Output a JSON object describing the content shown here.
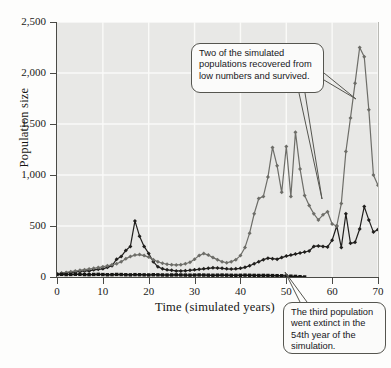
{
  "chart_data": {
    "type": "line",
    "title": "",
    "xlabel": "Time (simulated years)",
    "ylabel": "Population size",
    "xlim": [
      0,
      70
    ],
    "ylim": [
      0,
      2500
    ],
    "xticks": [
      0,
      10,
      20,
      30,
      40,
      50,
      60,
      70
    ],
    "yticks": [
      0,
      500,
      1000,
      1500,
      2000,
      2500
    ],
    "ytick_labels": [
      "0",
      "500",
      "1,000",
      "1,500",
      "2,000",
      "2,500"
    ],
    "xtick_labels": [
      "0",
      "10",
      "20",
      "30",
      "40",
      "50",
      "60",
      "70"
    ],
    "grid": true,
    "legend": "none",
    "series": [
      {
        "name": "Population 1 (recovered, black diamonds)",
        "color": "#201f1d",
        "marker": "diamond",
        "x": [
          0,
          1,
          2,
          3,
          4,
          5,
          6,
          7,
          8,
          9,
          10,
          11,
          12,
          13,
          14,
          15,
          16,
          17,
          18,
          19,
          20,
          21,
          22,
          23,
          24,
          25,
          26,
          27,
          28,
          29,
          30,
          31,
          32,
          33,
          34,
          35,
          36,
          37,
          38,
          39,
          40,
          41,
          42,
          43,
          44,
          45,
          46,
          47,
          48,
          49,
          50,
          51,
          52,
          53,
          54,
          55,
          56,
          57,
          58,
          59,
          60,
          61,
          62,
          63,
          64,
          65,
          66,
          67,
          68,
          69,
          70
        ],
        "values": [
          30,
          35,
          40,
          45,
          50,
          55,
          60,
          60,
          70,
          75,
          80,
          95,
          110,
          175,
          200,
          260,
          300,
          550,
          400,
          300,
          230,
          150,
          100,
          80,
          70,
          65,
          60,
          60,
          62,
          65,
          70,
          75,
          80,
          85,
          90,
          88,
          85,
          80,
          78,
          80,
          85,
          95,
          110,
          130,
          150,
          170,
          185,
          180,
          175,
          190,
          205,
          215,
          225,
          235,
          245,
          255,
          300,
          305,
          300,
          295,
          360,
          500,
          290,
          620,
          330,
          340,
          470,
          690,
          560,
          440,
          465
        ]
      },
      {
        "name": "Population 2 (recovered, gray diamonds)",
        "color": "#6d6d68",
        "marker": "diamond",
        "x": [
          0,
          1,
          2,
          3,
          4,
          5,
          6,
          7,
          8,
          9,
          10,
          11,
          12,
          13,
          14,
          15,
          16,
          17,
          18,
          19,
          20,
          21,
          22,
          23,
          24,
          25,
          26,
          27,
          28,
          29,
          30,
          31,
          32,
          33,
          34,
          35,
          36,
          37,
          38,
          39,
          40,
          41,
          42,
          43,
          44,
          45,
          46,
          47,
          48,
          49,
          50,
          51,
          52,
          53,
          54,
          55,
          56,
          57,
          58,
          59,
          60,
          61,
          62,
          63,
          64,
          65,
          66,
          67,
          68,
          69,
          70
        ],
        "values": [
          30,
          38,
          45,
          52,
          58,
          65,
          72,
          78,
          85,
          92,
          100,
          110,
          120,
          130,
          150,
          180,
          200,
          215,
          220,
          210,
          195,
          170,
          150,
          135,
          125,
          120,
          118,
          120,
          130,
          145,
          175,
          210,
          230,
          215,
          190,
          170,
          150,
          140,
          150,
          170,
          210,
          290,
          430,
          620,
          770,
          790,
          980,
          1270,
          1090,
          830,
          1280,
          790,
          1420,
          1060,
          800,
          700,
          620,
          560,
          610,
          640,
          520,
          500,
          720,
          1230,
          1560,
          1900,
          2250,
          2160,
          1640,
          1000,
          900
        ]
      },
      {
        "name": "Population 3 (extinct year 54, black squares)",
        "color": "#151513",
        "marker": "square",
        "extinct_year": 54,
        "x": [
          0,
          1,
          2,
          3,
          4,
          5,
          6,
          7,
          8,
          9,
          10,
          11,
          12,
          13,
          14,
          15,
          16,
          17,
          18,
          19,
          20,
          21,
          22,
          23,
          24,
          25,
          26,
          27,
          28,
          29,
          30,
          31,
          32,
          33,
          34,
          35,
          36,
          37,
          38,
          39,
          40,
          41,
          42,
          43,
          44,
          45,
          46,
          47,
          48,
          49,
          50,
          51,
          52,
          53,
          54
        ],
        "values": [
          25,
          26,
          24,
          25,
          27,
          26,
          24,
          23,
          25,
          26,
          24,
          22,
          23,
          25,
          24,
          22,
          21,
          23,
          22,
          21,
          20,
          22,
          21,
          20,
          19,
          20,
          21,
          20,
          19,
          18,
          19,
          20,
          19,
          18,
          17,
          18,
          19,
          18,
          17,
          16,
          17,
          18,
          17,
          16,
          15,
          16,
          15,
          14,
          13,
          12,
          10,
          8,
          6,
          3,
          0
        ]
      }
    ],
    "annotations": [
      {
        "id": "callout-recovered",
        "text": "Two of the simulated populations recovered from low numbers and survived.",
        "points_to": [
          "series-1",
          "series-2"
        ]
      },
      {
        "id": "callout-extinct",
        "text": "The third population went extinct in the 54th year of the simulation.",
        "points_to": [
          "series-3"
        ]
      }
    ]
  },
  "axes": {
    "y_title": "Population size",
    "x_title": "Time (simulated years)"
  }
}
